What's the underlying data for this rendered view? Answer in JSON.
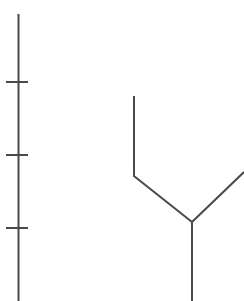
{
  "figure": {
    "type": "phylogenetic-tree-fragment",
    "width": 244,
    "height": 301,
    "background_color": "#ffffff",
    "stroke_color": "#4a4a4a",
    "stroke_width": 2.0
  },
  "scale_axis": {
    "name": "vertical-scale-bar",
    "orientation": "vertical",
    "line": {
      "x": 18.5,
      "y_top": 14,
      "y_bottom": 301
    },
    "tick_length": 22,
    "tick_x_start": 6,
    "tick_x_end": 28,
    "tick_positions_y": [
      82,
      155,
      228
    ],
    "tick_spacing": 73,
    "tick_count": 3,
    "labels": []
  },
  "tree": {
    "name": "cladogram-branches",
    "junction": {
      "x": 192,
      "y": 222
    },
    "branches": [
      {
        "name": "left-clade-branch",
        "segments": [
          {
            "x1": 134,
            "y1": 96,
            "x2": 134,
            "y2": 176
          },
          {
            "x1": 134,
            "y1": 176,
            "x2": 192,
            "y2": 222
          }
        ]
      },
      {
        "name": "right-clade-branch",
        "segments": [
          {
            "x1": 192,
            "y1": 222,
            "x2": 244,
            "y2": 172
          }
        ]
      },
      {
        "name": "root-stem",
        "segments": [
          {
            "x1": 192,
            "y1": 222,
            "x2": 192,
            "y2": 301
          }
        ]
      }
    ]
  },
  "chart_data": {
    "type": "line",
    "title": "",
    "xlabel": "",
    "ylabel": "",
    "grid": false,
    "legend": "none",
    "series": [
      {
        "name": "scale-bar",
        "points": [
          [
            18.5,
            14
          ],
          [
            18.5,
            301
          ]
        ]
      },
      {
        "name": "scale-tick-1",
        "points": [
          [
            6,
            82
          ],
          [
            28,
            82
          ]
        ]
      },
      {
        "name": "scale-tick-2",
        "points": [
          [
            6,
            155
          ],
          [
            28,
            155
          ]
        ]
      },
      {
        "name": "scale-tick-3",
        "points": [
          [
            6,
            228
          ],
          [
            28,
            228
          ]
        ]
      },
      {
        "name": "left-branch",
        "points": [
          [
            134,
            96
          ],
          [
            134,
            176
          ],
          [
            192,
            222
          ]
        ]
      },
      {
        "name": "right-branch",
        "points": [
          [
            192,
            222
          ],
          [
            244,
            172
          ]
        ]
      },
      {
        "name": "root-stem",
        "points": [
          [
            192,
            222
          ],
          [
            192,
            301
          ]
        ]
      }
    ]
  }
}
